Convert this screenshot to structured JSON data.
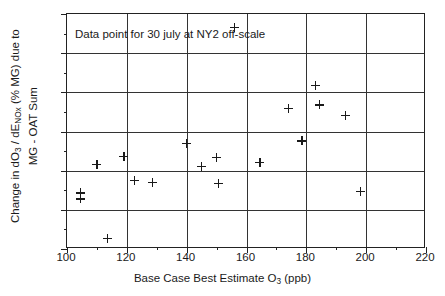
{
  "chart_data": {
    "type": "scatter",
    "title": "",
    "xlabel": "Base Case Best Estimate O3 (ppb)",
    "xlabel_parts": {
      "pre": "Base Case Best Estimate O",
      "sub": "3",
      "post": " (ppb)"
    },
    "ylabel_line1_parts": {
      "a": "Change in dO",
      "a_sub": "3",
      "b": " / dE",
      "b_sub": "NOx",
      "c": " (% MG) due to"
    },
    "ylabel_line2": "MG - OAT Sum",
    "ylabel": "Change in dO3 / dENOx (% MG) due to MG - OAT Sum",
    "xlim": [
      100,
      220
    ],
    "ylim": [
      -10,
      50
    ],
    "xticks": [
      100,
      120,
      140,
      160,
      180,
      200,
      220
    ],
    "xtick_labels": [
      "100",
      "120",
      "140",
      "160",
      "180",
      "200",
      "220"
    ],
    "xticks_minor": [
      110,
      130,
      150,
      170,
      190,
      210
    ],
    "yticks": [
      -10,
      0,
      10,
      20,
      30,
      40,
      50
    ],
    "ytick_labels": [
      "-10",
      "0",
      "10",
      "20",
      "30",
      "40",
      "50"
    ],
    "yticks_minor": [
      -5,
      5,
      15,
      25,
      35,
      45
    ],
    "grid": true,
    "grid_axes": "both",
    "marker": "plus",
    "marker_color": "#1a1a1a",
    "legend": "none",
    "annotations": [
      {
        "text": "Data point for 30 july at NY2 off-scale",
        "x": 103,
        "y": 44.5
      }
    ],
    "points": [
      {
        "x": 104.5,
        "y": 4.3
      },
      {
        "x": 104.5,
        "y": 2.8
      },
      {
        "x": 110.0,
        "y": 11.7
      },
      {
        "x": 113.5,
        "y": -7.2
      },
      {
        "x": 119.0,
        "y": 13.6
      },
      {
        "x": 122.5,
        "y": 7.6
      },
      {
        "x": 128.5,
        "y": 7.0
      },
      {
        "x": 140.0,
        "y": 16.9
      },
      {
        "x": 145.0,
        "y": 11.0
      },
      {
        "x": 150.0,
        "y": 13.4
      },
      {
        "x": 150.5,
        "y": 6.7
      },
      {
        "x": 156.0,
        "y": 46.5
      },
      {
        "x": 164.5,
        "y": 12.2
      },
      {
        "x": 174.0,
        "y": 26.0
      },
      {
        "x": 178.5,
        "y": 17.6
      },
      {
        "x": 183.0,
        "y": 31.7
      },
      {
        "x": 184.5,
        "y": 26.8
      },
      {
        "x": 193.0,
        "y": 24.1
      },
      {
        "x": 198.0,
        "y": 4.8
      }
    ]
  }
}
